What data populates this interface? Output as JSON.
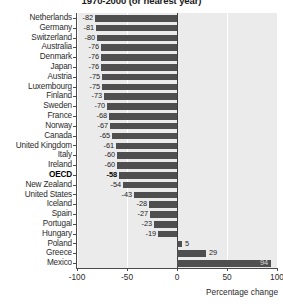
{
  "chart_data": {
    "type": "bar",
    "orientation": "horizontal",
    "title": "1970-2000 (or nearest year)",
    "xlabel": "Percentage change",
    "ylabel": "",
    "xlim": [
      -100,
      100
    ],
    "xticks": [
      -100,
      -50,
      0,
      50,
      100
    ],
    "xtick_labels": [
      "-100",
      "-50",
      "0",
      "50",
      "100"
    ],
    "grid": "vertical",
    "legend": "none",
    "zero_line": 0,
    "highlight_category": "OECD",
    "categories": [
      "Netherlands",
      "Germany",
      "Switzerland",
      "Australia",
      "Denmark",
      "Japan",
      "Austria",
      "Luxembourg",
      "Finland",
      "Sweden",
      "France",
      "Norway",
      "Canada",
      "United Kingdom",
      "Italy",
      "Ireland",
      "OECD",
      "New Zealand",
      "United States",
      "Iceland",
      "Spain",
      "Portugal",
      "Hungary",
      "Poland",
      "Greece",
      "Mexico"
    ],
    "values": [
      -82,
      -81,
      -80,
      -76,
      -76,
      -76,
      -75,
      -75,
      -73,
      -70,
      -68,
      -67,
      -65,
      -61,
      -60,
      -60,
      -58,
      -54,
      -43,
      -28,
      -27,
      -23,
      -19,
      5,
      29,
      94
    ],
    "value_labels": [
      "-82",
      "-81",
      "-80",
      "-76",
      "-76",
      "-76",
      "-75",
      "-75",
      "-73",
      "-70",
      "-68",
      "-67",
      "-65",
      "-61",
      "-60",
      "-60",
      "-58",
      "-54",
      "-43",
      "-28",
      "-27",
      "-23",
      "-19",
      "5",
      "29",
      "94"
    ],
    "colors": {
      "bar": "#4f4f4f",
      "plot_background": "#ebebeb",
      "grid": "#ffffff",
      "axis": "#4a4a4a",
      "text": "#2b2b2b"
    }
  }
}
